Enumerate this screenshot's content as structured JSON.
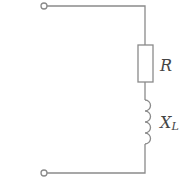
{
  "diagram": {
    "type": "circuit",
    "colors": {
      "wire": "#8a8a8a",
      "label": "#444444",
      "background": "#ffffff"
    },
    "terminals": [
      {
        "id": "top-terminal",
        "x": 44,
        "y": 6
      },
      {
        "id": "bottom-terminal",
        "x": 44,
        "y": 173
      }
    ],
    "components": [
      {
        "id": "resistor",
        "kind": "resistor",
        "label": "R"
      },
      {
        "id": "inductor",
        "kind": "inductor",
        "label_main": "X",
        "label_sub": "L"
      }
    ]
  }
}
